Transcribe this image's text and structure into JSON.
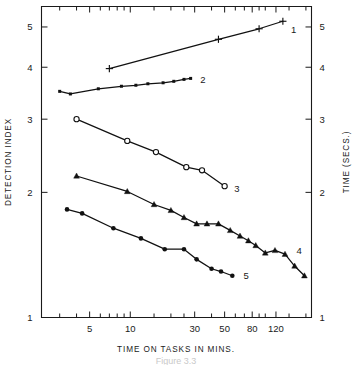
{
  "chart_data": {
    "type": "line",
    "title": "",
    "xlabel": "TIME ON TASKS IN MINS.",
    "ylabel": "DETECTION INDEX",
    "y2label": "TIME (SECS.)",
    "xscale": "log",
    "yscale": "log",
    "xlim": [
      2.2,
      220
    ],
    "ylim": [
      1.0,
      5.6
    ],
    "grid": false,
    "legend_position": "inline-right-of-each-series",
    "x_tick_labels": [
      "5",
      "10",
      "30",
      "50",
      "80",
      "120"
    ],
    "x_tick_values": [
      5,
      10,
      30,
      50,
      80,
      120
    ],
    "x_minor_ticks": [
      3,
      4,
      6,
      7,
      8,
      9,
      15,
      20,
      25,
      40,
      60,
      70,
      90,
      100,
      150,
      200
    ],
    "y_tick_labels": [
      "1",
      "2",
      "3",
      "4",
      "5"
    ],
    "y_tick_values": [
      1,
      2,
      3,
      4,
      5
    ],
    "y2_tick_labels": [
      "1",
      "2",
      "3",
      "4",
      "5"
    ],
    "y2_tick_values": [
      1,
      2,
      3,
      4,
      5
    ],
    "caption": "Figure 3.3",
    "series": [
      {
        "name": "1",
        "label": "1",
        "marker": "plus",
        "x": [
          7.0,
          45.0,
          90.0,
          135.0
        ],
        "y": [
          3.97,
          4.67,
          4.95,
          5.16
        ]
      },
      {
        "name": "2",
        "label": "2",
        "marker": "square",
        "x": [
          3.0,
          3.6,
          5.8,
          8.6,
          11.0,
          13.5,
          17.5,
          21.0,
          25.0,
          28.0
        ],
        "y": [
          3.5,
          3.45,
          3.55,
          3.6,
          3.62,
          3.65,
          3.67,
          3.7,
          3.74,
          3.76
        ]
      },
      {
        "name": "3",
        "label": "3",
        "marker": "circle-open",
        "x": [
          4.0,
          9.5,
          15.5,
          26.0,
          34.0,
          50.0
        ],
        "y": [
          3.0,
          2.66,
          2.5,
          2.3,
          2.26,
          2.07
        ]
      },
      {
        "name": "4",
        "label": "4",
        "marker": "triangle",
        "x": [
          4.0,
          9.5,
          15.0,
          20.0,
          25.0,
          31.0,
          37.0,
          45.0,
          55.0,
          65.0,
          75.0,
          85.0,
          100.0,
          118.0,
          140.0,
          165.0,
          195.0
        ],
        "y": [
          2.19,
          2.01,
          1.87,
          1.81,
          1.74,
          1.68,
          1.68,
          1.68,
          1.62,
          1.57,
          1.53,
          1.49,
          1.43,
          1.45,
          1.42,
          1.33,
          1.26
        ]
      },
      {
        "name": "5",
        "label": "5",
        "marker": "dot",
        "x": [
          3.4,
          4.4,
          7.5,
          12.0,
          18.0,
          25.0,
          31.0,
          40.0,
          47.0,
          57.0
        ],
        "y": [
          1.82,
          1.78,
          1.64,
          1.55,
          1.46,
          1.46,
          1.38,
          1.31,
          1.29,
          1.26
        ]
      }
    ],
    "series_label_positions": [
      {
        "name": "1",
        "x": 155.0,
        "y": 4.93
      },
      {
        "name": "2",
        "x": 33.0,
        "y": 3.74
      },
      {
        "name": "3",
        "x": 59.0,
        "y": 2.04
      },
      {
        "name": "4",
        "x": 170.0,
        "y": 1.45
      },
      {
        "name": "5",
        "x": 69.0,
        "y": 1.26
      }
    ]
  }
}
